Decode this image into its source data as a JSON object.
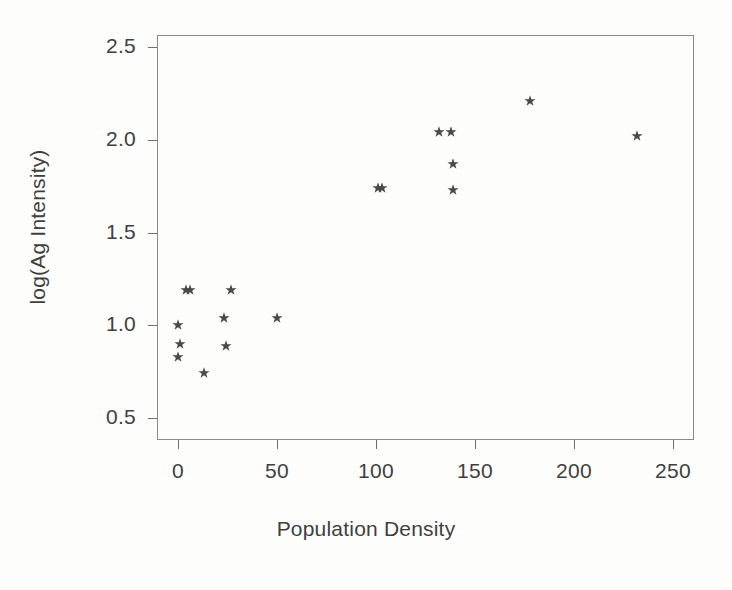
{
  "chart_data": {
    "type": "scatter",
    "title": "",
    "xlabel": "Population Density",
    "ylabel": "log(Ag Intensity)",
    "xlim": [
      -11,
      261
    ],
    "ylim": [
      0.42,
      2.58
    ],
    "grid": false,
    "legend": null,
    "marker": "star",
    "marker_color": "#4a4a4a",
    "xticks": [
      0,
      50,
      100,
      150,
      200,
      250
    ],
    "xtick_labels": [
      "0",
      "50",
      "100",
      "150",
      "200",
      "250"
    ],
    "yticks": [
      0.5,
      1.0,
      1.5,
      2.0,
      2.5
    ],
    "ytick_labels": [
      "0.5",
      "1.0",
      "1.5",
      "2.0",
      "2.5"
    ],
    "points": [
      {
        "x": 0,
        "y": 1.0
      },
      {
        "x": 1,
        "y": 0.9
      },
      {
        "x": 0,
        "y": 0.83
      },
      {
        "x": 13,
        "y": 0.74
      },
      {
        "x": 4,
        "y": 1.19
      },
      {
        "x": 6,
        "y": 1.19
      },
      {
        "x": 23,
        "y": 1.04
      },
      {
        "x": 24,
        "y": 0.89
      },
      {
        "x": 27,
        "y": 1.19
      },
      {
        "x": 50,
        "y": 1.04
      },
      {
        "x": 101,
        "y": 1.74
      },
      {
        "x": 103,
        "y": 1.74
      },
      {
        "x": 132,
        "y": 2.04
      },
      {
        "x": 138,
        "y": 2.04
      },
      {
        "x": 139,
        "y": 1.87
      },
      {
        "x": 139,
        "y": 1.73
      },
      {
        "x": 178,
        "y": 2.21
      },
      {
        "x": 232,
        "y": 2.02
      }
    ]
  },
  "axes": {
    "x_title": "Population Density",
    "y_title": "log(Ag Intensity)"
  }
}
